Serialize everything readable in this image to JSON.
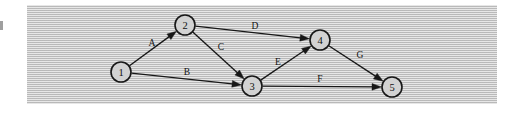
{
  "figure": {
    "type": "directed-graph",
    "panel": {
      "background_color": "#c9c9c9",
      "texture": "horizontal-scanlines",
      "x": 27,
      "y": 5,
      "width": 470,
      "height": 99
    },
    "colors": {
      "line": "#171717",
      "node_fill": "#d2d2d2",
      "node_stroke": "#171717",
      "page_background": "#ffffff"
    },
    "nodes": [
      {
        "id": "1",
        "label": "1",
        "x": 121,
        "y": 72,
        "r": 10
      },
      {
        "id": "2",
        "label": "2",
        "x": 185,
        "y": 25,
        "r": 10
      },
      {
        "id": "3",
        "label": "3",
        "x": 252,
        "y": 86,
        "r": 10
      },
      {
        "id": "4",
        "label": "4",
        "x": 320,
        "y": 40,
        "r": 10
      },
      {
        "id": "5",
        "label": "5",
        "x": 392,
        "y": 87,
        "r": 10
      }
    ],
    "edges": [
      {
        "id": "A",
        "label": "A",
        "from": "1",
        "to": "2",
        "label_x": 152,
        "label_y": 43
      },
      {
        "id": "B",
        "label": "B",
        "from": "1",
        "to": "3",
        "label_x": 187,
        "label_y": 72
      },
      {
        "id": "C",
        "label": "C",
        "from": "2",
        "to": "3",
        "label_x": 221,
        "label_y": 47
      },
      {
        "id": "D",
        "label": "D",
        "from": "2",
        "to": "4",
        "label_x": 255,
        "label_y": 26
      },
      {
        "id": "E",
        "label": "E",
        "from": "3",
        "to": "4",
        "label_x": 278,
        "label_y": 62
      },
      {
        "id": "F",
        "label": "F",
        "from": "3",
        "to": "5",
        "label_x": 320,
        "label_y": 79
      },
      {
        "id": "G",
        "label": "G",
        "from": "4",
        "to": "5",
        "label_x": 360,
        "label_y": 55
      }
    ]
  }
}
